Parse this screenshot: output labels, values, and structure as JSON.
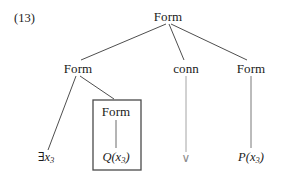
{
  "figure": {
    "example_number": "(13)",
    "type": "syntax-tree",
    "caption": "",
    "background_color": "#ffffff",
    "line_color": "#3a3a3a",
    "text_color": "#1a1a1a",
    "box_border_color": "#4a4a4a"
  },
  "tree": {
    "root": {
      "id": "root-form",
      "label": "Form",
      "x": 168,
      "y": 16
    },
    "level2": [
      {
        "id": "left-form",
        "label": "Form",
        "x": 78,
        "y": 68
      },
      {
        "id": "conn",
        "label": "conn",
        "x": 186,
        "y": 68
      },
      {
        "id": "right-form",
        "label": "Form",
        "x": 251,
        "y": 68
      }
    ],
    "level3": [
      {
        "id": "boxed-form",
        "label": "Form",
        "x": 116,
        "y": 111
      }
    ],
    "leaves": [
      {
        "id": "leaf-exists",
        "label": "∃x₃",
        "base": "∃x",
        "sub": "3",
        "x": 46,
        "y": 158,
        "style": "quantifier"
      },
      {
        "id": "leaf-q",
        "label": "Q(x₃)",
        "base_italic": "Q(",
        "var": "x",
        "sub": "3",
        "close": ")",
        "x": 116,
        "y": 158,
        "style": "predicate"
      },
      {
        "id": "leaf-or",
        "label": "∨",
        "x": 186,
        "y": 158,
        "style": "connective"
      },
      {
        "id": "leaf-p",
        "label": "P(x₃)",
        "base_italic": "P(",
        "var": "x",
        "sub": "3",
        "close": ")",
        "x": 251,
        "y": 158,
        "style": "predicate"
      }
    ],
    "box": {
      "id": "highlight-box",
      "x": 93,
      "y": 100,
      "width": 48,
      "height": 70,
      "label": "boxed-subtree"
    },
    "edges": [
      {
        "from": "root-form",
        "to": "left-form",
        "x1": 166,
        "y1": 24,
        "x2": 81,
        "y2": 60
      },
      {
        "from": "root-form",
        "to": "conn",
        "x1": 169,
        "y1": 24,
        "x2": 184,
        "y2": 60
      },
      {
        "from": "root-form",
        "to": "right-form",
        "x1": 171,
        "y1": 24,
        "x2": 247,
        "y2": 60
      },
      {
        "from": "left-form",
        "to": "leaf-exists",
        "x1": 76,
        "y1": 76,
        "x2": 48,
        "y2": 150
      },
      {
        "from": "left-form",
        "to": "boxed-form",
        "x1": 80,
        "y1": 76,
        "x2": 114,
        "y2": 99
      },
      {
        "from": "boxed-form",
        "to": "leaf-q",
        "x1": 116,
        "y1": 120,
        "x2": 116,
        "y2": 148
      },
      {
        "from": "conn",
        "to": "leaf-or",
        "x1": 186,
        "y1": 76,
        "x2": 186,
        "y2": 152
      },
      {
        "from": "right-form",
        "to": "leaf-p",
        "x1": 251,
        "y1": 76,
        "x2": 251,
        "y2": 148
      }
    ]
  }
}
